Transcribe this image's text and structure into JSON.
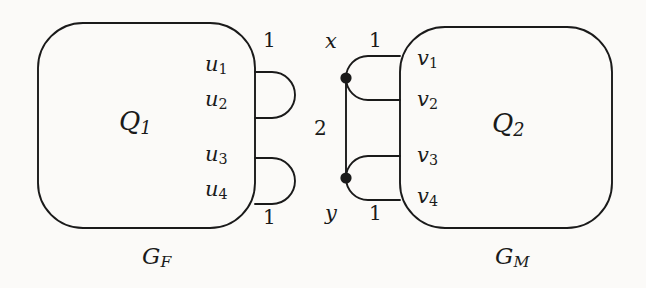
{
  "figure": {
    "name": "graph-gadget-diagram",
    "background_color": "#fbfaf8",
    "stroke_color": "#1a1a1a"
  },
  "left_block": {
    "label": "Q",
    "label_sub": "1",
    "caption": "G",
    "caption_sub": "F",
    "terminals": [
      {
        "label": "u",
        "sub": "1"
      },
      {
        "label": "u",
        "sub": "2"
      },
      {
        "label": "u",
        "sub": "3"
      },
      {
        "label": "u",
        "sub": "4"
      }
    ],
    "edge_weights": [
      "1",
      "1"
    ]
  },
  "right_block": {
    "label": "Q",
    "label_sub": "2",
    "caption": "G",
    "caption_sub": "M",
    "terminals": [
      {
        "label": "v",
        "sub": "1"
      },
      {
        "label": "v",
        "sub": "2"
      },
      {
        "label": "v",
        "sub": "3"
      },
      {
        "label": "v",
        "sub": "4"
      }
    ],
    "edge_weights": [
      "1",
      "1"
    ]
  },
  "middle": {
    "top_vertex": "x",
    "bottom_vertex": "y",
    "edge_weight": "2"
  }
}
